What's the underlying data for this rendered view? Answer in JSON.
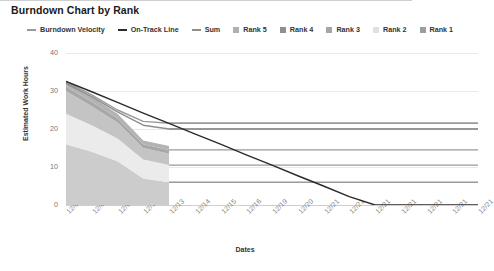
{
  "chart_data": {
    "type": "area",
    "title": "Burndown Chart by Rank",
    "xlabel": "Dates",
    "ylabel": "Estimated Work Hours",
    "ylim": [
      0,
      40
    ],
    "yticks": [
      0,
      10,
      20,
      30,
      40
    ],
    "grid": true,
    "legend_position": "top",
    "categories": [
      "12/07",
      "12/08",
      "12/09",
      "12/12",
      "12/13",
      "12/14",
      "12/15",
      "12/16",
      "12/19",
      "12/20",
      "12/21",
      "12/21",
      "12/21",
      "12/21",
      "12/21",
      "12/21",
      "12/21"
    ],
    "series": [
      {
        "name": "Burndown Velocity",
        "type": "line",
        "color": "#9a9a9a",
        "values": [
          32.5,
          29.0,
          25.0,
          22.0,
          21.5,
          21.5,
          21.5,
          21.5,
          21.5,
          21.5,
          21.5,
          21.5,
          21.5,
          21.5,
          21.5,
          21.5,
          21.5
        ]
      },
      {
        "name": "On-Track Line",
        "type": "line",
        "color": "#2b2b2b",
        "values": [
          32.5,
          29.8,
          27.0,
          24.2,
          21.5,
          18.7,
          16.0,
          13.2,
          10.5,
          7.7,
          5.0,
          2.2,
          0,
          0,
          0,
          0,
          0
        ]
      },
      {
        "name": "Sum",
        "type": "line",
        "color": "#8e8e8e",
        "values": [
          32.0,
          28.5,
          24.5,
          21.0,
          20.0,
          20.0,
          20.0,
          20.0,
          20.0,
          20.0,
          20.0,
          20.0,
          20.0,
          20.0,
          20.0,
          20.0,
          20.0
        ]
      },
      {
        "name": "Rank 5",
        "type": "area",
        "color": "#b3b3b3",
        "values": [
          1.5,
          1.3,
          1.2,
          1.0,
          1.0,
          1.0,
          1.0,
          1.0,
          1.0,
          1.0,
          1.0,
          1.0,
          1.0,
          1.0,
          1.0,
          1.0,
          1.0
        ]
      },
      {
        "name": "Rank 4",
        "type": "area",
        "color": "#a8a8a8",
        "values": [
          1.2,
          1.2,
          1.1,
          1.0,
          1.0,
          1.0,
          1.0,
          1.0,
          1.0,
          1.0,
          1.0,
          1.0,
          1.0,
          1.0,
          1.0,
          1.0,
          1.0
        ]
      },
      {
        "name": "Rank 3",
        "type": "area",
        "color": "#c4c4c4",
        "values": [
          6.0,
          5.0,
          4.2,
          3.0,
          3.0,
          3.0,
          3.0,
          3.0,
          3.0,
          3.0,
          3.0,
          3.0,
          3.0,
          3.0,
          3.0,
          3.0,
          3.0
        ]
      },
      {
        "name": "Rank 2",
        "type": "area",
        "color": "#ebebeb",
        "values": [
          8.0,
          7.0,
          6.0,
          5.0,
          4.5,
          4.5,
          4.5,
          4.5,
          4.5,
          4.5,
          4.5,
          4.5,
          4.5,
          4.5,
          4.5,
          4.5,
          4.5
        ]
      },
      {
        "name": "Rank 1",
        "type": "area",
        "color": "#cccccc",
        "values": [
          16.0,
          14.0,
          11.5,
          7.0,
          6.0,
          6.0,
          6.0,
          6.0,
          6.0,
          6.0,
          6.0,
          6.0,
          6.0,
          6.0,
          6.0,
          6.0,
          6.0
        ]
      }
    ],
    "flat_line_values": [
      21.5,
      20.0,
      14.5,
      10.5,
      6.0
    ],
    "area_end_index": 4
  },
  "legend": {
    "items": [
      {
        "label": "Burndown Velocity",
        "marker": "line",
        "color": "#9a9a9a"
      },
      {
        "label": "On-Track Line",
        "marker": "line",
        "color": "#2b2b2b"
      },
      {
        "label": "Sum",
        "marker": "line",
        "color": "#8e8e8e"
      },
      {
        "label": "Rank 5",
        "marker": "box",
        "color": "#b0b0b0"
      },
      {
        "label": "Rank 4",
        "marker": "box",
        "color": "#8f8f8f"
      },
      {
        "label": "Rank 3",
        "marker": "box",
        "color": "#a6a6a6"
      },
      {
        "label": "Rank 2",
        "marker": "box",
        "color": "#e0e0e0"
      },
      {
        "label": "Rank 1",
        "marker": "box",
        "color": "#9d9d9d"
      }
    ]
  }
}
